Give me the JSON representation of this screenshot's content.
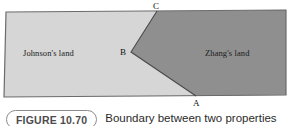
{
  "figure": {
    "badge_label": "FIGURE 10.70",
    "caption": "Boundary between two properties"
  },
  "diagram": {
    "regions": [
      {
        "id": "johnson",
        "label": "Johnson's land",
        "fill": "#d6d6d6"
      },
      {
        "id": "zhang",
        "label": "Zhang's land",
        "fill": "#8f8f8f"
      }
    ],
    "vertices": [
      {
        "id": "A",
        "label": "A",
        "x": 196,
        "y": 96
      },
      {
        "id": "B",
        "label": "B",
        "x": 131,
        "y": 52
      },
      {
        "id": "C",
        "label": "C",
        "x": 157,
        "y": 11
      }
    ],
    "outline_color": "#6b6b6b",
    "boundary_color": "#4a4a4a",
    "plot_outline": {
      "top_left": {
        "x": 6,
        "y": 12
      },
      "top_right": {
        "x": 286,
        "y": 10
      },
      "bottom_right": {
        "x": 286,
        "y": 95
      },
      "bottom_left": {
        "x": 4,
        "y": 97
      }
    }
  }
}
